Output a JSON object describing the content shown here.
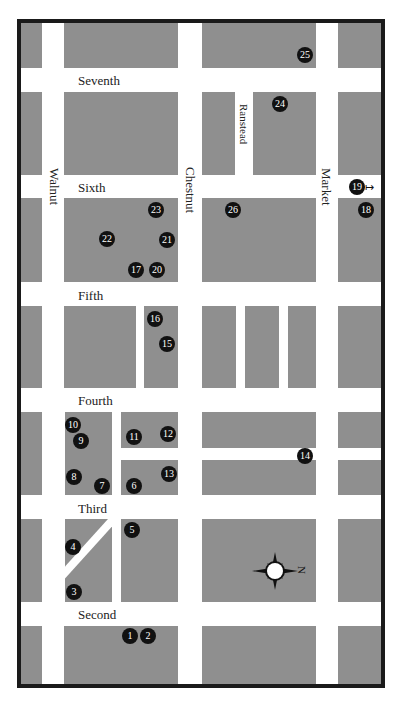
{
  "map": {
    "streets_horizontal": [
      {
        "name": "Seventh",
        "label_x": 78,
        "label_y": 74
      },
      {
        "name": "Sixth",
        "label_x": 78,
        "label_y": 181
      },
      {
        "name": "Fifth",
        "label_x": 78,
        "label_y": 289
      },
      {
        "name": "Fourth",
        "label_x": 78,
        "label_y": 394
      },
      {
        "name": "Third",
        "label_x": 78,
        "label_y": 502
      },
      {
        "name": "Second",
        "label_x": 78,
        "label_y": 608
      }
    ],
    "streets_vertical": [
      {
        "name": "Walnut",
        "label_x": 61,
        "label_y": 168
      },
      {
        "name": "Chestnut",
        "label_x": 197,
        "label_y": 167
      },
      {
        "name": "Ranstead",
        "label_x": 251,
        "label_y": 104
      },
      {
        "name": "Market",
        "label_x": 333,
        "label_y": 168
      }
    ],
    "markers": [
      {
        "id": "1",
        "x": 130,
        "y": 636
      },
      {
        "id": "2",
        "x": 148,
        "y": 636
      },
      {
        "id": "3",
        "x": 74,
        "y": 592
      },
      {
        "id": "4",
        "x": 73,
        "y": 547
      },
      {
        "id": "5",
        "x": 132,
        "y": 530
      },
      {
        "id": "6",
        "x": 134,
        "y": 486
      },
      {
        "id": "7",
        "x": 102,
        "y": 486
      },
      {
        "id": "8",
        "x": 74,
        "y": 477
      },
      {
        "id": "9",
        "x": 81,
        "y": 441
      },
      {
        "id": "10",
        "x": 73,
        "y": 425
      },
      {
        "id": "11",
        "x": 134,
        "y": 437
      },
      {
        "id": "12",
        "x": 168,
        "y": 434
      },
      {
        "id": "13",
        "x": 169,
        "y": 474
      },
      {
        "id": "14",
        "x": 305,
        "y": 456
      },
      {
        "id": "15",
        "x": 167,
        "y": 344
      },
      {
        "id": "16",
        "x": 155,
        "y": 319
      },
      {
        "id": "17",
        "x": 136,
        "y": 270
      },
      {
        "id": "18",
        "x": 366,
        "y": 210
      },
      {
        "id": "19",
        "x": 357,
        "y": 187
      },
      {
        "id": "20",
        "x": 157,
        "y": 270
      },
      {
        "id": "21",
        "x": 167,
        "y": 240
      },
      {
        "id": "22",
        "x": 107,
        "y": 239
      },
      {
        "id": "23",
        "x": 156,
        "y": 210
      },
      {
        "id": "24",
        "x": 280,
        "y": 104
      },
      {
        "id": "25",
        "x": 305,
        "y": 55
      },
      {
        "id": "26",
        "x": 233,
        "y": 210
      }
    ],
    "marker_19_arrow": "↦",
    "compass": {
      "label": "N",
      "x": 275,
      "y": 571
    },
    "colors": {
      "block": "#8f8f8f",
      "road": "#ffffff",
      "border": "#1a1a1a",
      "marker": "#111111"
    }
  }
}
